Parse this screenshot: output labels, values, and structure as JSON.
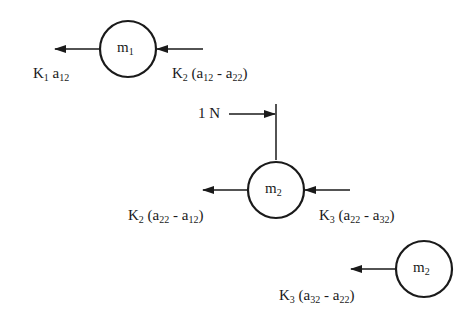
{
  "diagram": {
    "type": "free-body diagram",
    "masses": [
      {
        "id": "m1",
        "base": "m",
        "sub": "1"
      },
      {
        "id": "m2",
        "base": "m",
        "sub": "2"
      },
      {
        "id": "m3",
        "base": "m",
        "sub": "2"
      }
    ],
    "forces": {
      "f1": {
        "k": "K",
        "ksub": "1",
        "a": "a",
        "asub": "12"
      },
      "f2": {
        "k": "K",
        "ksub": "2",
        "open": "(",
        "a1": "a",
        "a1sub": "12",
        "minus": " - ",
        "a2": "a",
        "a2sub": "22",
        "close": ")"
      },
      "f3": {
        "k": "K",
        "ksub": "2",
        "open": "(",
        "a1": "a",
        "a1sub": "22",
        "minus": " - ",
        "a2": "a",
        "a2sub": "12",
        "close": ")"
      },
      "f4": {
        "k": "K",
        "ksub": "3",
        "open": "(",
        "a1": "a",
        "a1sub": "22",
        "minus": " - ",
        "a2": "a",
        "a2sub": "32",
        "close": ")"
      },
      "f5": {
        "k": "K",
        "ksub": "3",
        "open": "(",
        "a1": "a",
        "a1sub": "32",
        "minus": " - ",
        "a2": "a",
        "a2sub": "22",
        "close": ")"
      }
    },
    "unit_force": {
      "label": "1 N"
    }
  }
}
